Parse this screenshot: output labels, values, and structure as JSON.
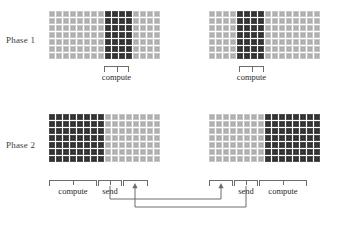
{
  "diagram": {
    "colors": {
      "light_cell": "#b6b6b6",
      "dark_cell": "#3a3a3a",
      "line": "#6d6d6d",
      "text": "#2b2b2b",
      "background": "#ffffff"
    },
    "grid_spec": {
      "columns": 16,
      "rows": 7,
      "cell_px": 6
    }
  },
  "phases": [
    {
      "label": "Phase 1",
      "panels": [
        {
          "name": "phase1-left",
          "columns_dark": [
            8,
            9,
            10,
            11
          ],
          "brackets": [
            {
              "name": "compute",
              "label": "compute",
              "start_col": 8,
              "end_col": 11,
              "has_tick": true,
              "has_arrow": false
            }
          ]
        },
        {
          "name": "phase1-right",
          "columns_dark": [
            4,
            5,
            6,
            7
          ],
          "brackets": [
            {
              "name": "compute",
              "label": "compute",
              "start_col": 4,
              "end_col": 7,
              "has_tick": true,
              "has_arrow": false
            }
          ]
        }
      ]
    },
    {
      "label": "Phase 2",
      "panels": [
        {
          "name": "phase2-left",
          "columns_dark": [
            0,
            1,
            2,
            3,
            4,
            5,
            6,
            7
          ],
          "brackets": [
            {
              "name": "compute",
              "label": "compute",
              "start_col": 0,
              "end_col": 7,
              "has_tick": true,
              "has_arrow": false
            },
            {
              "name": "send",
              "label": "send",
              "start_col": 8,
              "end_col": 11,
              "has_tick": true,
              "has_arrow": false
            },
            {
              "name": "receive",
              "label": "",
              "start_col": 12,
              "end_col": 15,
              "has_tick": false,
              "has_arrow": true
            }
          ]
        },
        {
          "name": "phase2-right",
          "columns_dark": [
            8,
            9,
            10,
            11,
            12,
            13,
            14,
            15
          ],
          "brackets": [
            {
              "name": "receive",
              "label": "",
              "start_col": 0,
              "end_col": 3,
              "has_tick": false,
              "has_arrow": true
            },
            {
              "name": "send",
              "label": "send",
              "start_col": 4,
              "end_col": 7,
              "has_tick": true,
              "has_arrow": false
            },
            {
              "name": "compute",
              "label": "compute",
              "start_col": 8,
              "end_col": 15,
              "has_tick": true,
              "has_arrow": false
            }
          ]
        }
      ]
    }
  ],
  "connectors": [
    {
      "name": "left-send-to-right-receive",
      "from": "phase2-left-send",
      "to": "phase2-right-receive"
    },
    {
      "name": "right-send-to-left-receive",
      "from": "phase2-right-send",
      "to": "phase2-left-receive"
    }
  ]
}
